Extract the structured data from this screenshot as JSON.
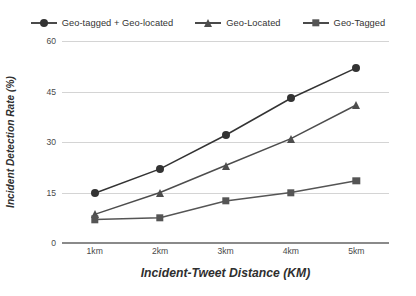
{
  "chart_data": {
    "type": "line",
    "title": "",
    "xlabel": "Incident-Tweet Distance (KM)",
    "ylabel": "Incident Detection Rate (%)",
    "categories": [
      "1km",
      "2km",
      "3km",
      "4km",
      "5km"
    ],
    "ylim": [
      0,
      60
    ],
    "yticks": [
      0,
      15,
      30,
      45,
      60
    ],
    "grid": true,
    "legend_position": "top",
    "series": [
      {
        "name": "Geo-tagged + Geo-located",
        "marker": "circle",
        "color": "#333333",
        "values": [
          14.8,
          22,
          32,
          43,
          52
        ]
      },
      {
        "name": "Geo-Located",
        "marker": "triangle",
        "color": "#4d4d4d",
        "values": [
          8.5,
          15,
          23,
          31,
          41
        ]
      },
      {
        "name": "Geo-Tagged",
        "marker": "square",
        "color": "#555555",
        "values": [
          7,
          7.5,
          12.5,
          15,
          18.5
        ]
      }
    ]
  },
  "legend": {
    "entries": [
      {
        "label": "Geo-tagged + Geo-located",
        "marker": "circle"
      },
      {
        "label": "Geo-Located",
        "marker": "triangle"
      },
      {
        "label": "Geo-Tagged",
        "marker": "square"
      }
    ]
  },
  "axes": {
    "y_tick_labels": [
      "60",
      "45",
      "30",
      "15",
      "0"
    ],
    "x_tick_labels": [
      "1km",
      "2km",
      "3km",
      "4km",
      "5km"
    ],
    "x_title": "Incident-Tweet Distance (KM)",
    "y_title": "Incident Detection Rate (%)"
  },
  "colors": {
    "gridline": "#d4d4d4",
    "baseline": "#8a8a8a",
    "line": "#4a4a4a",
    "text": "#3a3a3a",
    "background": "#ffffff"
  }
}
